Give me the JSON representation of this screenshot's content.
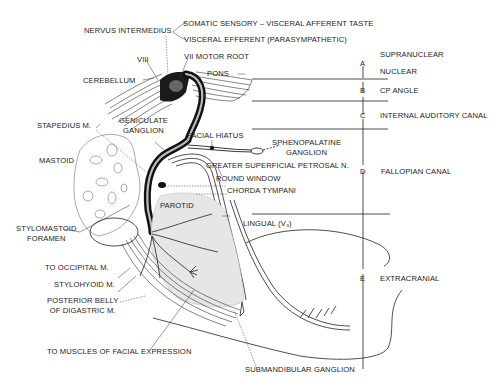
{
  "figure": {
    "type": "anatomical-diagram"
  },
  "labels": {
    "nervus_intermedius": "NERVUS INTERMEDIUS",
    "somatic_sensory": "SOMATIC SENSORY – VISCERAL AFFERENT TASTE",
    "visceral_efferent": "VISCERAL EFFERENT (PARASYMPATHETIC)",
    "viii": "VIII",
    "vii_motor_root": "VII MOTOR ROOT",
    "cerebellum": "CEREBELLUM",
    "pons": "PONS",
    "geniculate_ganglion_1": "GENICULATE",
    "geniculate_ganglion_2": "GANGLION",
    "stapedius": "STAPEDIUS M.",
    "facial_hiatus": "FACIAL HIATUS",
    "sphenopalatine_1": "SPHENOPALATINE",
    "sphenopalatine_2": "GANGLION",
    "mastoid": "MASTOID",
    "greater_superficial_petrosal": "GREATER SUPERFICIAL PETROSAL N.",
    "round_window": "ROUND WINDOW",
    "chorda_tympani": "CHORDA TYMPANI",
    "parotid": "PAROTID",
    "stylomastoid_1": "STYLOMASTOID",
    "stylomastoid_2": "FORAMEN",
    "lingual": "LINGUAL (V₃)",
    "to_occipital": "TO OCCIPITAL M.",
    "stylohyoid": "STYLOHYOID M.",
    "posterior_belly_1": "POSTERIOR BELLY",
    "posterior_belly_2": "OF DIGASTRIC M.",
    "to_muscles": "TO MUSCLES OF FACIAL EXPRESSION",
    "submandibular": "SUBMANDIBULAR GANGLION"
  },
  "segments": [
    {
      "letter": "A",
      "names": [
        "SUPRANUCLEAR",
        "NUCLEAR"
      ]
    },
    {
      "letter": "B",
      "names": [
        "CP ANGLE"
      ]
    },
    {
      "letter": "C",
      "names": [
        "INTERNAL AUDITORY CANAL"
      ]
    },
    {
      "letter": "D",
      "names": [
        "FALLOPIAN CANAL"
      ]
    },
    {
      "letter": "E",
      "names": [
        "EXTRACRANIAL"
      ]
    }
  ],
  "colors": {
    "ink": "#1c1c1c",
    "nerve_black": "#111111",
    "parotid_fill": "#e4e4e4",
    "bone_line": "#555555",
    "background": "#ffffff"
  }
}
